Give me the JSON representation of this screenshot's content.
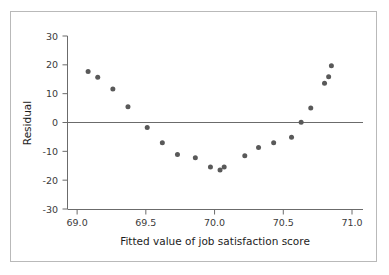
{
  "chart_data": {
    "type": "scatter",
    "title": "",
    "xlabel": "Fitted value of job satisfaction score",
    "ylabel": "Residual",
    "xlim": [
      68.93,
      71.08
    ],
    "ylim": [
      -30,
      30
    ],
    "xticks": [
      69.0,
      69.5,
      70.0,
      70.5,
      71.0
    ],
    "xtick_labels": [
      "69.0",
      "69.5",
      "70.0",
      "70.5",
      "71.0"
    ],
    "yticks": [
      30,
      20,
      10,
      0,
      -10,
      -20,
      -30
    ],
    "ytick_labels": [
      "30",
      "20",
      "10",
      "0",
      "-10",
      "-20",
      "-30"
    ],
    "grid": false,
    "legend": null,
    "reference_lines": [
      {
        "axis": "y",
        "value": 0,
        "color": "#6b6b6b"
      }
    ],
    "marker": {
      "shape": "circle",
      "color": "#595959",
      "size_px": 5
    },
    "points": [
      {
        "x": 69.08,
        "y": 17.7
      },
      {
        "x": 69.15,
        "y": 15.7
      },
      {
        "x": 69.26,
        "y": 11.6
      },
      {
        "x": 69.37,
        "y": 5.5
      },
      {
        "x": 69.51,
        "y": -1.7
      },
      {
        "x": 69.62,
        "y": -7.0
      },
      {
        "x": 69.73,
        "y": -11.1
      },
      {
        "x": 69.86,
        "y": -12.2
      },
      {
        "x": 69.97,
        "y": -15.4
      },
      {
        "x": 70.04,
        "y": -16.5
      },
      {
        "x": 70.07,
        "y": -15.4
      },
      {
        "x": 70.22,
        "y": -11.5
      },
      {
        "x": 70.32,
        "y": -8.7
      },
      {
        "x": 70.43,
        "y": -7.0
      },
      {
        "x": 70.56,
        "y": -5.1
      },
      {
        "x": 70.63,
        "y": 0.1
      },
      {
        "x": 70.7,
        "y": 5.0
      },
      {
        "x": 70.8,
        "y": 13.6
      },
      {
        "x": 70.83,
        "y": 15.9
      },
      {
        "x": 70.85,
        "y": 19.7
      }
    ]
  },
  "axes": {
    "y_axis_title": "Residual",
    "x_axis_title": "Fitted value of job satisfaction score"
  }
}
